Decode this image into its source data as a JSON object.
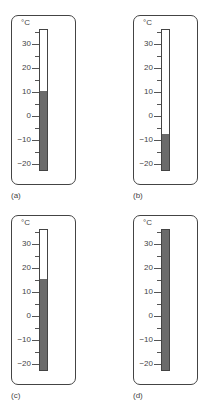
{
  "chart_data": [
    {
      "type": "thermometer",
      "label": "(a)",
      "unit": "°C",
      "tick_labels": [
        "30",
        "20",
        "10",
        "0",
        "-10",
        "-20"
      ],
      "scale_min": -23,
      "scale_max": 36,
      "value": 10
    },
    {
      "type": "thermometer",
      "label": "(b)",
      "unit": "°C",
      "tick_labels": [
        "30",
        "20",
        "10",
        "0",
        "-10",
        "-20"
      ],
      "scale_min": -23,
      "scale_max": 36,
      "value": -8
    },
    {
      "type": "thermometer",
      "label": "(c)",
      "unit": "°C",
      "tick_labels": [
        "30",
        "20",
        "10",
        "0",
        "-10",
        "-20"
      ],
      "scale_min": -23,
      "scale_max": 36,
      "value": 15
    },
    {
      "type": "thermometer",
      "label": "(d)",
      "unit": "°C",
      "tick_labels": [
        "30",
        "20",
        "10",
        "0",
        "-10",
        "-20"
      ],
      "scale_min": -23,
      "scale_max": 36,
      "value": 36
    }
  ],
  "panels": [
    {
      "caption": "(a)",
      "unit": "°C",
      "ticks": [
        "30",
        "20",
        "10",
        "0",
        "−10",
        "−20"
      ]
    },
    {
      "caption": "(b)",
      "unit": "°C",
      "ticks": [
        "30",
        "20",
        "10",
        "0",
        "−10",
        "−20"
      ]
    },
    {
      "caption": "(c)",
      "unit": "°C",
      "ticks": [
        "30",
        "20",
        "10",
        "0",
        "−10",
        "−20"
      ]
    },
    {
      "caption": "(d)",
      "unit": "°C",
      "ticks": [
        "30",
        "20",
        "10",
        "0",
        "−10",
        "−20"
      ]
    }
  ],
  "colors": {
    "fill": "#6b6b6b",
    "outline": "#444444"
  }
}
